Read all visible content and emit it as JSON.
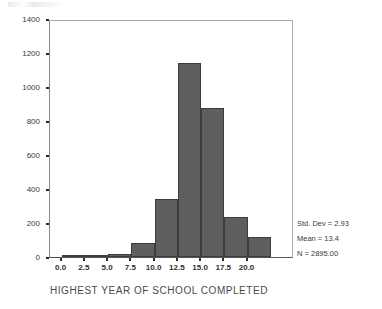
{
  "chart_data": {
    "type": "bar",
    "title": "",
    "xlabel": "HIGHEST YEAR OF SCHOOL COMPLETED",
    "ylabel": "",
    "xlim": [
      -1.25,
      25.0
    ],
    "ylim": [
      0,
      1400
    ],
    "grid": false,
    "legend": null,
    "bin_width": 2.5,
    "bin_starts": [
      0,
      2.5,
      5,
      7.5,
      10,
      12.5,
      15,
      17.5,
      20,
      22.5
    ],
    "categories": [
      "0.0",
      "2.5",
      "5.0",
      "7.5",
      "10.0",
      "12.5",
      "15.0",
      "17.5",
      "20.0",
      "22.5"
    ],
    "values": [
      2,
      3,
      20,
      85,
      340,
      1140,
      877,
      238,
      115,
      0
    ],
    "xticks": [
      "0.0",
      "2.5",
      "5.0",
      "7.5",
      "10.0",
      "12.5",
      "15.0",
      "17.5",
      "20.0"
    ],
    "xtick_values": [
      0.0,
      2.5,
      5.0,
      7.5,
      10.0,
      12.5,
      15.0,
      17.5,
      20.0
    ],
    "yticks": [
      "0",
      "200",
      "400",
      "600",
      "800",
      "1000",
      "1200",
      "1400"
    ],
    "ytick_values": [
      0,
      200,
      400,
      600,
      800,
      1000,
      1200,
      1400
    ],
    "bar_color": "#5f5f5f",
    "bar_edge_color": "#3c3c3c",
    "annotations": [
      "Std. Dev = 2.93",
      "Mean = 13.4",
      "N = 2895.00"
    ]
  },
  "stats": {
    "std_dev": "Std. Dev = 2.93",
    "mean": "Mean = 13.4",
    "n": "N = 2895.00"
  }
}
